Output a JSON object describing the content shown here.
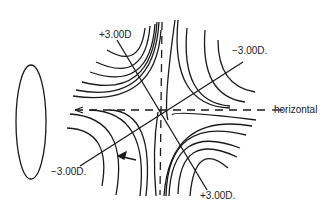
{
  "diagram": {
    "labels": {
      "top_left": "+3.00D",
      "top_right": "−3.00D.",
      "bottom_left": "−3.00D.",
      "bottom_right": "+3.00D.",
      "horizontal": "horizontal"
    },
    "elements": [
      "ellipse",
      "hyperbolic-contours",
      "axis-lines",
      "dashed-horizontal-meridian",
      "dashed-vertical-meridian",
      "arrow"
    ],
    "colors": {
      "stroke": "#1a1a1a",
      "background": "#ffffff"
    }
  }
}
